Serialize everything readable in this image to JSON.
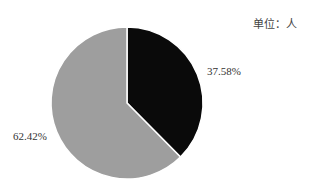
{
  "chart": {
    "unit_label": "单位：人",
    "labels": [
      "37.58%",
      "62.42%"
    ]
  },
  "chart_data": {
    "type": "pie",
    "title": "",
    "unit": "单位：人",
    "categories": [
      "slice-1",
      "slice-2"
    ],
    "values": [
      37.58,
      62.42
    ],
    "colors": [
      "#0a0a0a",
      "#9e9e9e"
    ],
    "labels": [
      "37.58%",
      "62.42%"
    ],
    "start_angle": "12 o'clock, clockwise",
    "legend": "none"
  }
}
